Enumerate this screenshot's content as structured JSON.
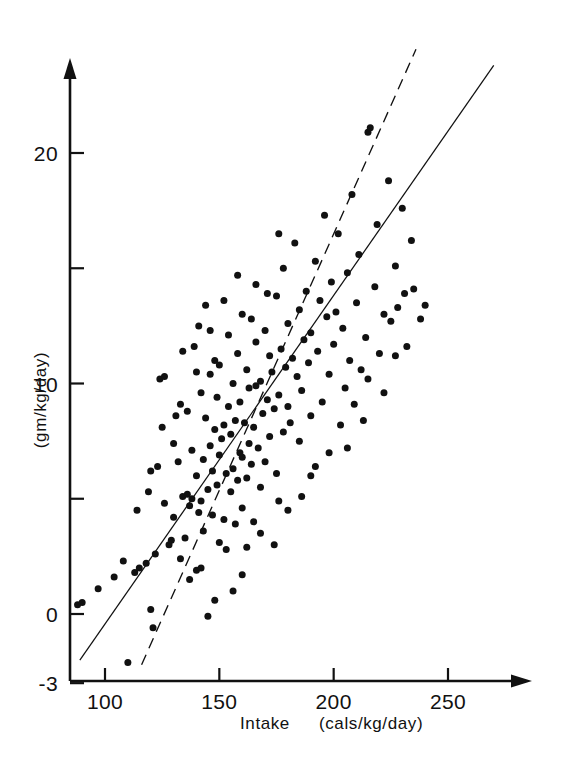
{
  "chart_data": {
    "type": "scatter",
    "title": "",
    "xlabel": "Intake   (cals/kg/day)",
    "xlabel_main": "Intake",
    "xlabel_units": "(cals/kg/day)",
    "ylabel": "(gm/kg/day)",
    "xlim": [
      84,
      270
    ],
    "ylim": [
      -3,
      24
    ],
    "xticks": [
      100,
      150,
      200,
      250
    ],
    "xtick_labels": [
      "100",
      "150",
      "200",
      "250"
    ],
    "yticks": [
      -3,
      0,
      5,
      10,
      15,
      20
    ],
    "ytick_labels": [
      "-3",
      "0",
      "",
      "10",
      "",
      "20"
    ],
    "grid": false,
    "legend": "none",
    "axis_style": "arrow-tipped open axes",
    "marker": "filled-circle",
    "marker_color": "#111111",
    "series": [
      {
        "name": "infants",
        "points": [
          [
            88,
            0.4
          ],
          [
            90,
            0.5
          ],
          [
            97,
            1.1
          ],
          [
            104,
            1.6
          ],
          [
            110,
            -2.1
          ],
          [
            113,
            1.8
          ],
          [
            115,
            2.0
          ],
          [
            118,
            2.2
          ],
          [
            120,
            0.2
          ],
          [
            121,
            -0.6
          ],
          [
            122,
            2.6
          ],
          [
            123,
            6.4
          ],
          [
            124,
            10.2
          ],
          [
            126,
            10.3
          ],
          [
            128,
            3.0
          ],
          [
            129,
            3.2
          ],
          [
            130,
            4.2
          ],
          [
            131,
            8.6
          ],
          [
            132,
            6.6
          ],
          [
            133,
            9.1
          ],
          [
            134,
            5.1
          ],
          [
            135,
            3.3
          ],
          [
            136,
            5.2
          ],
          [
            136,
            8.8
          ],
          [
            137,
            4.7
          ],
          [
            138,
            5.0
          ],
          [
            138,
            7.1
          ],
          [
            139,
            11.6
          ],
          [
            140,
            1.9
          ],
          [
            140,
            6.0
          ],
          [
            141,
            4.4
          ],
          [
            141,
            12.5
          ],
          [
            142,
            4.9
          ],
          [
            142,
            9.6
          ],
          [
            143,
            3.6
          ],
          [
            143,
            6.7
          ],
          [
            144,
            8.5
          ],
          [
            144,
            13.4
          ],
          [
            145,
            -0.1
          ],
          [
            145,
            5.4
          ],
          [
            146,
            7.3
          ],
          [
            146,
            10.4
          ],
          [
            147,
            4.3
          ],
          [
            147,
            6.2
          ],
          [
            148,
            8.0
          ],
          [
            148,
            11.0
          ],
          [
            149,
            5.6
          ],
          [
            149,
            9.4
          ],
          [
            150,
            3.1
          ],
          [
            150,
            6.9
          ],
          [
            150,
            10.8
          ],
          [
            151,
            7.6
          ],
          [
            152,
            4.1
          ],
          [
            152,
            8.2
          ],
          [
            153,
            2.8
          ],
          [
            153,
            6.1
          ],
          [
            154,
            9.0
          ],
          [
            154,
            12.1
          ],
          [
            155,
            5.3
          ],
          [
            155,
            7.8
          ],
          [
            156,
            6.3
          ],
          [
            156,
            10.0
          ],
          [
            157,
            3.9
          ],
          [
            157,
            8.4
          ],
          [
            158,
            5.8
          ],
          [
            158,
            11.3
          ],
          [
            159,
            7.0
          ],
          [
            159,
            9.2
          ],
          [
            160,
            4.6
          ],
          [
            160,
            6.8
          ],
          [
            160,
            13.0
          ],
          [
            161,
            8.3
          ],
          [
            162,
            5.9
          ],
          [
            162,
            10.6
          ],
          [
            163,
            7.4
          ],
          [
            163,
            9.8
          ],
          [
            164,
            6.5
          ],
          [
            164,
            12.8
          ],
          [
            165,
            4.0
          ],
          [
            165,
            8.1
          ],
          [
            166,
            9.9
          ],
          [
            166,
            11.8
          ],
          [
            167,
            7.2
          ],
          [
            168,
            5.5
          ],
          [
            168,
            10.1
          ],
          [
            169,
            8.7
          ],
          [
            170,
            6.6
          ],
          [
            170,
            12.3
          ],
          [
            171,
            9.3
          ],
          [
            172,
            7.7
          ],
          [
            172,
            11.2
          ],
          [
            173,
            10.5
          ],
          [
            174,
            8.9
          ],
          [
            175,
            6.1
          ],
          [
            175,
            13.8
          ],
          [
            176,
            9.5
          ],
          [
            177,
            11.5
          ],
          [
            178,
            7.9
          ],
          [
            178,
            15.0
          ],
          [
            179,
            10.7
          ],
          [
            180,
            9.0
          ],
          [
            180,
            12.6
          ],
          [
            181,
            8.3
          ],
          [
            182,
            11.1
          ],
          [
            183,
            16.1
          ],
          [
            184,
            10.3
          ],
          [
            185,
            7.5
          ],
          [
            185,
            13.2
          ],
          [
            186,
            9.7
          ],
          [
            187,
            11.9
          ],
          [
            188,
            14.0
          ],
          [
            189,
            10.9
          ],
          [
            190,
            8.6
          ],
          [
            190,
            12.2
          ],
          [
            192,
            15.3
          ],
          [
            193,
            11.4
          ],
          [
            194,
            13.6
          ],
          [
            195,
            9.2
          ],
          [
            196,
            17.3
          ],
          [
            197,
            12.9
          ],
          [
            198,
            10.4
          ],
          [
            199,
            14.4
          ],
          [
            200,
            11.7
          ],
          [
            201,
            13.1
          ],
          [
            202,
            16.5
          ],
          [
            204,
            12.4
          ],
          [
            205,
            9.8
          ],
          [
            206,
            14.8
          ],
          [
            207,
            11.0
          ],
          [
            208,
            18.2
          ],
          [
            210,
            13.5
          ],
          [
            211,
            15.6
          ],
          [
            212,
            10.6
          ],
          [
            214,
            12.0
          ],
          [
            215,
            20.9
          ],
          [
            216,
            21.1
          ],
          [
            218,
            14.2
          ],
          [
            219,
            16.9
          ],
          [
            220,
            11.3
          ],
          [
            222,
            13.0
          ],
          [
            224,
            18.8
          ],
          [
            225,
            12.7
          ],
          [
            227,
            15.1
          ],
          [
            228,
            13.3
          ],
          [
            230,
            17.6
          ],
          [
            231,
            13.9
          ],
          [
            232,
            11.6
          ],
          [
            235,
            14.1
          ],
          [
            238,
            12.8
          ],
          [
            240,
            13.4
          ],
          [
            120,
            6.2
          ],
          [
            126,
            4.8
          ],
          [
            133,
            2.4
          ],
          [
            137,
            1.5
          ],
          [
            142,
            2.0
          ],
          [
            156,
            1.0
          ],
          [
            162,
            2.9
          ],
          [
            168,
            3.5
          ],
          [
            174,
            3.0
          ],
          [
            180,
            4.5
          ],
          [
            186,
            5.1
          ],
          [
            192,
            6.4
          ],
          [
            198,
            7.0
          ],
          [
            203,
            8.2
          ],
          [
            209,
            9.1
          ],
          [
            215,
            10.2
          ],
          [
            222,
            9.6
          ],
          [
            234,
            16.2
          ],
          [
            227,
            11.2
          ],
          [
            213,
            8.4
          ],
          [
            206,
            7.2
          ],
          [
            190,
            6.0
          ],
          [
            176,
            4.9
          ],
          [
            160,
            1.7
          ],
          [
            148,
            0.6
          ],
          [
            152,
            13.6
          ],
          [
            158,
            14.7
          ],
          [
            166,
            14.3
          ],
          [
            171,
            13.9
          ],
          [
            176,
            16.5
          ],
          [
            146,
            12.3
          ],
          [
            140,
            10.5
          ],
          [
            134,
            11.4
          ],
          [
            130,
            7.4
          ],
          [
            125,
            8.1
          ],
          [
            119,
            5.3
          ],
          [
            114,
            4.5
          ],
          [
            108,
            2.3
          ]
        ]
      }
    ],
    "fit_lines": [
      {
        "name": "solid-regression-line",
        "style": "solid",
        "x_from": 89,
        "y_from": -2.0,
        "x_to": 270,
        "y_to": 23.8
      },
      {
        "name": "dashed-regression-line",
        "style": "dashed",
        "x_from": 116,
        "y_from": -2.2,
        "x_to": 236,
        "y_to": 24.5
      }
    ]
  },
  "figure": {
    "background_color": "#ffffff",
    "ink_color": "#111111"
  }
}
